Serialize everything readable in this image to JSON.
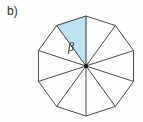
{
  "figure": {
    "part_label": "b)",
    "angle_label": "β",
    "shape_name": "regular-decagon",
    "sides": 10,
    "center": {
      "x": 86,
      "y": 66
    },
    "radius": 50,
    "rotation_deg": 18,
    "shaded_sector_index": 6,
    "colors": {
      "background": "#fefefe",
      "stroke": "#4a4a4a",
      "shade_fill": "#bfe2f2",
      "shade_stroke": "#8fc7de",
      "center_dot": "#1a1a1a",
      "label_text": "#2b2b2b"
    },
    "stroke_width": 1,
    "center_dot_radius": 2.2,
    "angle_label_pos": {
      "x": 71,
      "y": 48
    }
  }
}
